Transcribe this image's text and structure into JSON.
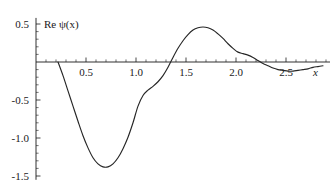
{
  "chart_data": {
    "type": "line",
    "title": "",
    "ylabel": "Re ψ(x)",
    "xlabel": "x",
    "xlim": [
      0.0,
      2.95
    ],
    "ylim": [
      -1.55,
      0.58
    ],
    "grid": false,
    "legend": null,
    "x_ticks": [
      0.5,
      1.0,
      1.5,
      2.0,
      2.5
    ],
    "x_tick_labels": [
      "0.5",
      "1.0",
      "1.5",
      "2.0",
      "2.5"
    ],
    "x_minor_tick_step": 0.1,
    "y_ticks": [
      0.5,
      -0.5,
      -1.0,
      -1.5
    ],
    "y_tick_labels": [
      "0.5",
      "-0.5",
      "-1.0",
      "-1.5"
    ],
    "y_minor_tick_step": 0.1,
    "curve_color": "#262626",
    "annotations": [],
    "series": [
      {
        "name": "Re ψ(x)",
        "x": [
          0.22,
          0.27,
          0.32,
          0.37,
          0.42,
          0.47,
          0.52,
          0.57,
          0.62,
          0.67,
          0.72,
          0.77,
          0.82,
          0.87,
          0.92,
          0.97,
          1.02,
          1.07,
          1.12,
          1.17,
          1.22,
          1.27,
          1.32,
          1.37,
          1.42,
          1.47,
          1.52,
          1.57,
          1.62,
          1.67,
          1.72,
          1.77,
          1.82,
          1.87,
          1.92,
          1.97,
          2.02,
          2.07,
          2.12,
          2.17,
          2.22,
          2.27,
          2.32,
          2.37,
          2.42,
          2.47,
          2.52,
          2.57,
          2.62,
          2.67,
          2.72,
          2.77,
          2.82,
          2.87
        ],
        "y": [
          0.0,
          -0.18,
          -0.38,
          -0.58,
          -0.78,
          -0.97,
          -1.13,
          -1.26,
          -1.34,
          -1.38,
          -1.38,
          -1.34,
          -1.26,
          -1.14,
          -0.99,
          -0.8,
          -0.58,
          -0.44,
          -0.37,
          -0.32,
          -0.26,
          -0.18,
          -0.07,
          0.06,
          0.18,
          0.28,
          0.36,
          0.42,
          0.45,
          0.46,
          0.45,
          0.42,
          0.37,
          0.31,
          0.24,
          0.18,
          0.13,
          0.11,
          0.09,
          0.06,
          0.02,
          -0.02,
          -0.05,
          -0.08,
          -0.1,
          -0.11,
          -0.12,
          -0.12,
          -0.11,
          -0.1,
          -0.09,
          -0.07,
          -0.06,
          -0.05
        ]
      }
    ]
  },
  "axes": {
    "x_axis_name": "x",
    "y_axis_name": "Re ψ(x)"
  }
}
